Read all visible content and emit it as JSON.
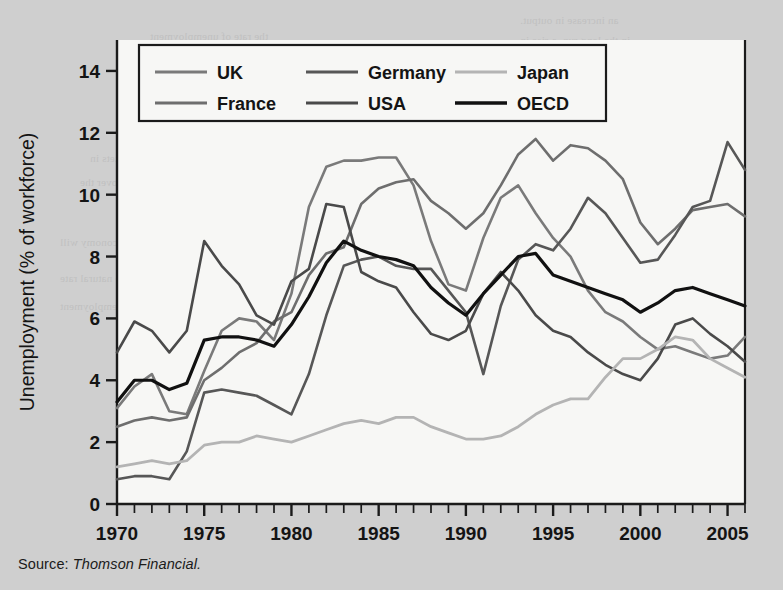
{
  "figure": {
    "source_label": "Source:",
    "source_name": "Thomson Financial.",
    "background_color": "#cfcfcf",
    "plot_background_color": "#f7f7f5"
  },
  "legend": {
    "position": "top-left-inside",
    "entries": [
      {
        "label": "UK",
        "color": "#7a7a7a"
      },
      {
        "label": "Germany",
        "color": "#575757"
      },
      {
        "label": "Japan",
        "color": "#b4b4b4"
      },
      {
        "label": "France",
        "color": "#6e6e6e"
      },
      {
        "label": "USA",
        "color": "#4a4a4a"
      },
      {
        "label": "OECD",
        "color": "#111111"
      }
    ]
  },
  "chart_data": {
    "type": "line",
    "title": "",
    "xlabel": "",
    "ylabel": "Unemployment (% of workforce)",
    "xlim": [
      1970,
      2006
    ],
    "ylim": [
      0,
      15
    ],
    "grid": false,
    "x_major_ticks": [
      1970,
      1975,
      1980,
      1985,
      1990,
      1995,
      2000,
      2005
    ],
    "x_minor_tick_step": 1,
    "y_ticks": [
      0,
      2,
      4,
      6,
      8,
      10,
      12,
      14
    ],
    "x": [
      1970,
      1971,
      1972,
      1973,
      1974,
      1975,
      1976,
      1977,
      1978,
      1979,
      1980,
      1981,
      1982,
      1983,
      1984,
      1985,
      1986,
      1987,
      1988,
      1989,
      1990,
      1991,
      1992,
      1993,
      1994,
      1995,
      1996,
      1997,
      1998,
      1999,
      2000,
      2001,
      2002,
      2003,
      2004,
      2005,
      2006
    ],
    "series": [
      {
        "name": "UK",
        "color": "#7a7a7a",
        "width": 2.6,
        "values": [
          3.1,
          3.8,
          4.2,
          3.0,
          2.9,
          4.3,
          5.6,
          6.0,
          5.9,
          5.3,
          6.8,
          9.6,
          10.9,
          11.1,
          11.1,
          11.2,
          11.2,
          10.3,
          8.5,
          7.1,
          6.9,
          8.6,
          9.9,
          10.3,
          9.4,
          8.6,
          8.0,
          6.9,
          6.2,
          5.9,
          5.4,
          5.0,
          5.1,
          4.9,
          4.7,
          4.8,
          5.4
        ]
      },
      {
        "name": "France",
        "color": "#6e6e6e",
        "width": 2.6,
        "values": [
          2.5,
          2.7,
          2.8,
          2.7,
          2.8,
          4.0,
          4.4,
          4.9,
          5.2,
          5.9,
          6.2,
          7.4,
          8.1,
          8.3,
          9.7,
          10.2,
          10.4,
          10.5,
          9.8,
          9.4,
          8.9,
          9.4,
          10.3,
          11.3,
          11.8,
          11.1,
          11.6,
          11.5,
          11.1,
          10.5,
          9.1,
          8.4,
          8.9,
          9.5,
          9.6,
          9.7,
          9.3
        ]
      },
      {
        "name": "Germany",
        "color": "#575757",
        "width": 2.6,
        "values": [
          0.8,
          0.9,
          0.9,
          0.8,
          1.7,
          3.6,
          3.7,
          3.6,
          3.5,
          3.2,
          2.9,
          4.2,
          6.1,
          7.7,
          7.9,
          8.0,
          7.7,
          7.6,
          7.6,
          6.9,
          6.2,
          4.2,
          6.4,
          7.9,
          8.4,
          8.2,
          8.9,
          9.9,
          9.4,
          8.6,
          7.8,
          7.9,
          8.7,
          9.6,
          9.8,
          11.7,
          10.8
        ]
      },
      {
        "name": "USA",
        "color": "#4a4a4a",
        "width": 2.6,
        "values": [
          4.9,
          5.9,
          5.6,
          4.9,
          5.6,
          8.5,
          7.7,
          7.1,
          6.1,
          5.8,
          7.2,
          7.6,
          9.7,
          9.6,
          7.5,
          7.2,
          7.0,
          6.2,
          5.5,
          5.3,
          5.6,
          6.8,
          7.5,
          6.9,
          6.1,
          5.6,
          5.4,
          4.9,
          4.5,
          4.2,
          4.0,
          4.7,
          5.8,
          6.0,
          5.5,
          5.1,
          4.6
        ]
      },
      {
        "name": "Japan",
        "color": "#b4b4b4",
        "width": 2.8,
        "values": [
          1.2,
          1.3,
          1.4,
          1.3,
          1.4,
          1.9,
          2.0,
          2.0,
          2.2,
          2.1,
          2.0,
          2.2,
          2.4,
          2.6,
          2.7,
          2.6,
          2.8,
          2.8,
          2.5,
          2.3,
          2.1,
          2.1,
          2.2,
          2.5,
          2.9,
          3.2,
          3.4,
          3.4,
          4.1,
          4.7,
          4.7,
          5.0,
          5.4,
          5.3,
          4.7,
          4.4,
          4.1
        ]
      },
      {
        "name": "OECD",
        "color": "#111111",
        "width": 3.2,
        "values": [
          3.3,
          4.0,
          4.0,
          3.7,
          3.9,
          5.3,
          5.4,
          5.4,
          5.3,
          5.1,
          5.8,
          6.7,
          7.8,
          8.5,
          8.2,
          8.0,
          7.9,
          7.7,
          7.0,
          6.5,
          6.1,
          6.8,
          7.4,
          8.0,
          8.1,
          7.4,
          7.2,
          7.0,
          6.8,
          6.6,
          6.2,
          6.5,
          6.9,
          7.0,
          6.8,
          6.6,
          6.4
        ]
      }
    ]
  },
  "bleed_text": [
    {
      "text": "an increase in output.",
      "x": 520,
      "y": 14
    },
    {
      "text": "the rate of unemployment",
      "x": 150,
      "y": 30
    },
    {
      "text": "in the long run, a rise in",
      "x": 520,
      "y": 34
    },
    {
      "text": "and output is reduced.",
      "x": 520,
      "y": 56
    },
    {
      "text": "an increase in the natural",
      "x": 520,
      "y": 78
    },
    {
      "text": "Unemployment",
      "x": 170,
      "y": 104
    },
    {
      "text": "will be a rise in the",
      "x": 520,
      "y": 100
    },
    {
      "text": "of labour markets in",
      "x": 90,
      "y": 152
    },
    {
      "text": "reducing the level of",
      "x": 520,
      "y": 150
    },
    {
      "text": "unemployment over the",
      "x": 80,
      "y": 176
    },
    {
      "text": "the wage rate and",
      "x": 530,
      "y": 176
    },
    {
      "text": "long run equilibrium",
      "x": 480,
      "y": 200
    },
    {
      "text": "of the economy will",
      "x": 60,
      "y": 236
    },
    {
      "text": "continue to fall",
      "x": 500,
      "y": 238
    },
    {
      "text": "reduce the natural rate",
      "x": 60,
      "y": 272
    },
    {
      "text": "of unemployment",
      "x": 60,
      "y": 300
    },
    {
      "text": "The",
      "x": 520,
      "y": 322
    },
    {
      "text": "and",
      "x": 520,
      "y": 346
    },
    {
      "text": "and the numbers",
      "x": 510,
      "y": 370
    },
    {
      "text": "in employment",
      "x": 510,
      "y": 396
    }
  ]
}
